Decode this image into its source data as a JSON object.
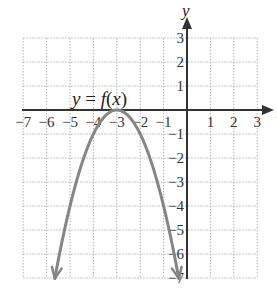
{
  "chart_data": {
    "type": "line",
    "title": "",
    "xlabel": "x",
    "ylabel": "y",
    "xlim": [
      -7,
      3
    ],
    "ylim": [
      -7,
      3
    ],
    "grid": true,
    "x_ticks": [
      "−7",
      "−6",
      "−5",
      "−4",
      "−3",
      "−2",
      "−1",
      "1",
      "2",
      "3"
    ],
    "x_tick_values": [
      -7,
      -6,
      -5,
      -4,
      -3,
      -2,
      -1,
      1,
      2,
      3
    ],
    "y_ticks": [
      "3",
      "2",
      "1",
      "−1",
      "−2",
      "−3",
      "−4",
      "−5",
      "−6",
      "−7"
    ],
    "y_tick_values": [
      3,
      2,
      1,
      -1,
      -2,
      -3,
      -4,
      -5,
      -6,
      -7
    ],
    "series": [
      {
        "name": "y = f(x)",
        "equation_estimate": "f(x) = -(x+3)^2",
        "vertex": [
          -3,
          0
        ],
        "x": [
          -5.65,
          -5,
          -4.5,
          -4,
          -3.5,
          -3,
          -2.5,
          -2,
          -1.5,
          -1,
          -0.35
        ],
        "y": [
          -7,
          -4,
          -2.25,
          -1,
          -0.25,
          0,
          -0.25,
          -1,
          -2.25,
          -4,
          -7
        ],
        "arrows_at_ends": true,
        "color": "#858585"
      }
    ],
    "annotations": [
      {
        "text": "y = f(x)",
        "position": [
          -4.6,
          0.3
        ]
      }
    ]
  },
  "labels": {
    "x_axis": "x",
    "y_axis": "y",
    "function_y": "y",
    "function_eq": " = ",
    "function_f": "f",
    "function_open": "(",
    "function_x": "x",
    "function_close": ")"
  },
  "colors": {
    "grid": "#b5b5b5",
    "axis": "#333333",
    "curve": "#858585"
  }
}
